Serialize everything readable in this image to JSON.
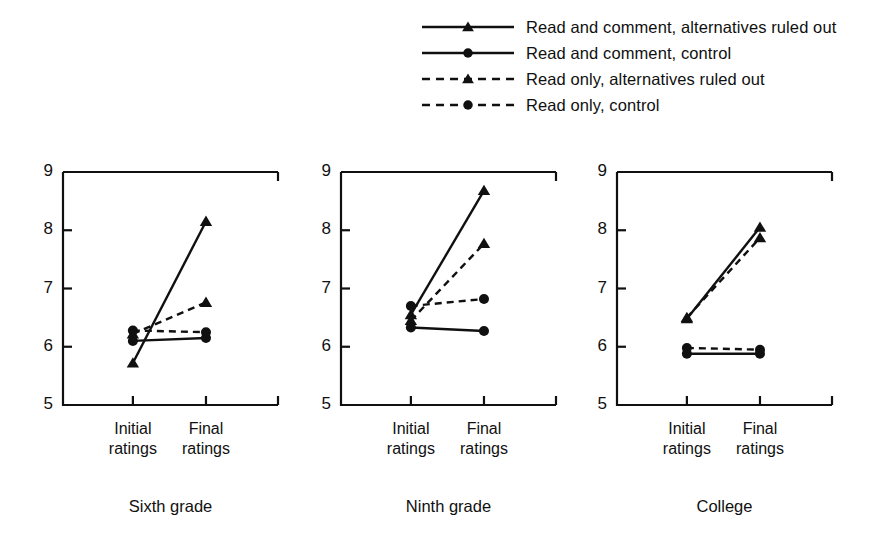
{
  "chart_data": {
    "type": "line",
    "title": "",
    "xlabel": "",
    "ylabel": "",
    "ylim": [
      5,
      9
    ],
    "yticks": [
      5,
      6,
      7,
      8,
      9
    ],
    "categories": [
      "Initial ratings",
      "Final ratings"
    ],
    "grid": false,
    "legend_position": "top-center",
    "panels": [
      {
        "name": "Sixth grade",
        "series": [
          {
            "name": "Read and comment, alternatives ruled out",
            "marker": "triangle",
            "line": "solid",
            "values": [
              5.72,
              8.15
            ]
          },
          {
            "name": "Read and comment, control",
            "marker": "circle",
            "line": "solid",
            "values": [
              6.1,
              6.15
            ]
          },
          {
            "name": "Read only, alternatives ruled out",
            "marker": "triangle",
            "line": "dashed",
            "values": [
              6.22,
              6.76
            ]
          },
          {
            "name": "Read only, control",
            "marker": "circle",
            "line": "dashed",
            "values": [
              6.28,
              6.25
            ]
          }
        ]
      },
      {
        "name": "Ninth grade",
        "series": [
          {
            "name": "Read and comment, alternatives ruled out",
            "marker": "triangle",
            "line": "solid",
            "values": [
              6.55,
              8.68
            ]
          },
          {
            "name": "Read and comment, control",
            "marker": "circle",
            "line": "solid",
            "values": [
              6.33,
              6.27
            ]
          },
          {
            "name": "Read only, alternatives ruled out",
            "marker": "triangle",
            "line": "dashed",
            "values": [
              6.45,
              7.77
            ]
          },
          {
            "name": "Read only, control",
            "marker": "circle",
            "line": "dashed",
            "values": [
              6.7,
              6.82
            ]
          }
        ]
      },
      {
        "name": "College",
        "series": [
          {
            "name": "Read and comment, alternatives ruled out",
            "marker": "triangle",
            "line": "solid",
            "values": [
              6.48,
              8.05
            ]
          },
          {
            "name": "Read and comment, control",
            "marker": "circle",
            "line": "solid",
            "values": [
              5.88,
              5.88
            ]
          },
          {
            "name": "Read only, alternatives ruled out",
            "marker": "triangle",
            "line": "dashed",
            "values": [
              6.5,
              7.87
            ]
          },
          {
            "name": "Read only, control",
            "marker": "circle",
            "line": "dashed",
            "values": [
              5.98,
              5.95
            ]
          }
        ]
      }
    ]
  },
  "legend": {
    "items": [
      {
        "label": "Read and comment, alternatives ruled out",
        "marker": "triangle",
        "line": "solid"
      },
      {
        "label": "Read and comment, control",
        "marker": "circle",
        "line": "solid"
      },
      {
        "label": "Read only, alternatives ruled out",
        "marker": "triangle",
        "line": "dashed"
      },
      {
        "label": "Read only, control",
        "marker": "circle",
        "line": "dashed"
      }
    ]
  },
  "axes": {
    "ytick_labels": [
      "9",
      "8",
      "7",
      "6",
      "5"
    ],
    "xtick_label_lines": [
      [
        "Initial",
        "ratings"
      ],
      [
        "Final",
        "ratings"
      ]
    ]
  },
  "panel_titles": [
    "Sixth grade",
    "Ninth grade",
    "College"
  ],
  "colors": {
    "ink": "#101010",
    "background": "#ffffff"
  }
}
